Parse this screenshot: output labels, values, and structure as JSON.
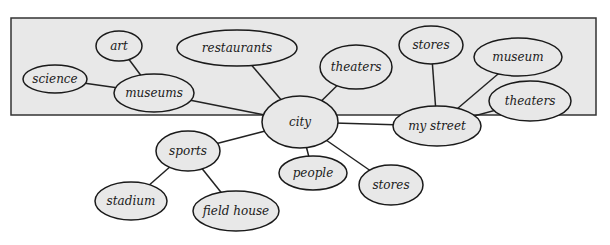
{
  "diagram": {
    "type": "concept-web",
    "background": "#e8e8e8",
    "border_color": "#333333",
    "line_color": "#222222",
    "nodes": [
      {
        "id": "city",
        "label": "city"
      },
      {
        "id": "museums",
        "label": "museums"
      },
      {
        "id": "art",
        "label": "art"
      },
      {
        "id": "science",
        "label": "science"
      },
      {
        "id": "restaurants",
        "label": "restaurants"
      },
      {
        "id": "theaters1",
        "label": "theaters"
      },
      {
        "id": "sports",
        "label": "sports"
      },
      {
        "id": "stadium",
        "label": "stadium"
      },
      {
        "id": "fieldhouse",
        "label": "field house"
      },
      {
        "id": "people",
        "label": "people"
      },
      {
        "id": "stores1",
        "label": "stores"
      },
      {
        "id": "mystreet",
        "label": "my street"
      },
      {
        "id": "stores2",
        "label": "stores"
      },
      {
        "id": "museum",
        "label": "museum"
      },
      {
        "id": "theaters2",
        "label": "theaters"
      }
    ],
    "edges": [
      [
        "city",
        "museums"
      ],
      [
        "museums",
        "art"
      ],
      [
        "museums",
        "science"
      ],
      [
        "city",
        "restaurants"
      ],
      [
        "city",
        "theaters1"
      ],
      [
        "city",
        "sports"
      ],
      [
        "sports",
        "stadium"
      ],
      [
        "sports",
        "fieldhouse"
      ],
      [
        "city",
        "people"
      ],
      [
        "city",
        "stores1"
      ],
      [
        "city",
        "mystreet"
      ],
      [
        "mystreet",
        "stores2"
      ],
      [
        "mystreet",
        "museum"
      ],
      [
        "mystreet",
        "theaters2"
      ]
    ]
  }
}
